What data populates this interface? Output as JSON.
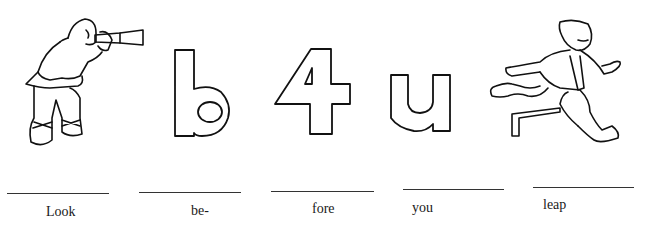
{
  "worksheet": {
    "panels": [
      {
        "picture": "man-with-telescope",
        "label": "Look"
      },
      {
        "picture": "letter-b",
        "label": "be-"
      },
      {
        "picture": "number-4",
        "label": "fore"
      },
      {
        "picture": "letter-u",
        "label": "you"
      },
      {
        "picture": "man-leaping-hurdle",
        "label": "leap"
      }
    ]
  }
}
